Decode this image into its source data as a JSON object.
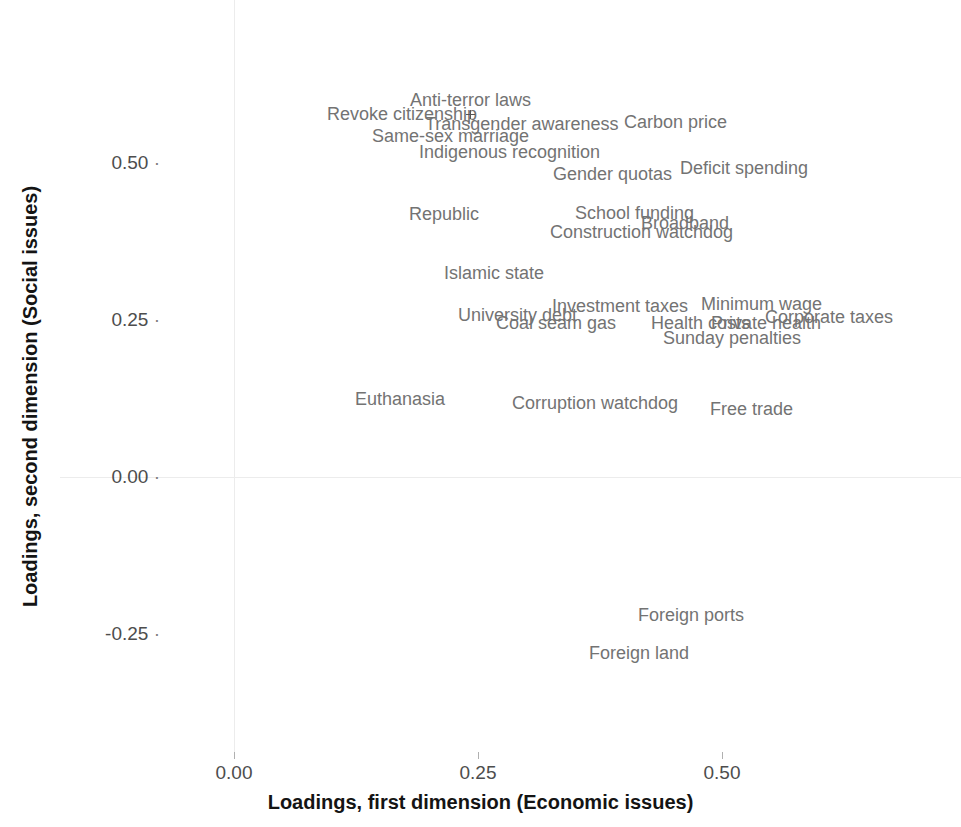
{
  "chart_data": {
    "type": "scatter",
    "title": "",
    "xlabel": "Loadings, first dimension (Economic issues)",
    "ylabel": "Loadings, second dimension (Social issues)",
    "xlim": [
      -0.09,
      0.73
    ],
    "ylim": [
      -0.36,
      0.63
    ],
    "xticks": [
      "0.00",
      "0.25",
      "0.50"
    ],
    "xtick_values": [
      0.0,
      0.25,
      0.5
    ],
    "yticks": [
      "0.50",
      "0.25",
      "0.00",
      "-0.25"
    ],
    "ytick_values": [
      0.5,
      0.25,
      0.0,
      -0.25
    ],
    "grid": "minimal-zero-lines",
    "legend": "none",
    "labels_only": true,
    "points": [
      {
        "label": "Anti-terror laws",
        "x": 0.242,
        "y": 0.6
      },
      {
        "label": "Revoke citizenship",
        "x": 0.172,
        "y": 0.578
      },
      {
        "label": "Transgender awareness",
        "x": 0.295,
        "y": 0.562
      },
      {
        "label": "Carbon price",
        "x": 0.452,
        "y": 0.565
      },
      {
        "label": "Same-sex marriage",
        "x": 0.222,
        "y": 0.543
      },
      {
        "label": "Indigenous recognition",
        "x": 0.282,
        "y": 0.518
      },
      {
        "label": "Gender quotas",
        "x": 0.388,
        "y": 0.482
      },
      {
        "label": "Deficit spending",
        "x": 0.523,
        "y": 0.492
      },
      {
        "label": "Republic",
        "x": 0.215,
        "y": 0.418
      },
      {
        "label": "School funding",
        "x": 0.41,
        "y": 0.42
      },
      {
        "label": "Broadband",
        "x": 0.462,
        "y": 0.405
      },
      {
        "label": "Construction watchdog",
        "x": 0.418,
        "y": 0.39
      },
      {
        "label": "Islamic state",
        "x": 0.266,
        "y": 0.325
      },
      {
        "label": "Investment taxes",
        "x": 0.396,
        "y": 0.272
      },
      {
        "label": "Minimum wage",
        "x": 0.54,
        "y": 0.275
      },
      {
        "label": "University debt",
        "x": 0.29,
        "y": 0.258
      },
      {
        "label": "Corporate taxes",
        "x": 0.61,
        "y": 0.255
      },
      {
        "label": "Coal seam gas",
        "x": 0.33,
        "y": 0.245
      },
      {
        "label": "Health costs",
        "x": 0.478,
        "y": 0.246
      },
      {
        "label": "Private health",
        "x": 0.545,
        "y": 0.246
      },
      {
        "label": "Sunday penalties",
        "x": 0.51,
        "y": 0.222
      },
      {
        "label": "Euthanasia",
        "x": 0.17,
        "y": 0.125
      },
      {
        "label": "Corruption watchdog",
        "x": 0.37,
        "y": 0.118
      },
      {
        "label": "Free trade",
        "x": 0.53,
        "y": 0.108
      },
      {
        "label": "Foreign ports",
        "x": 0.468,
        "y": -0.22
      },
      {
        "label": "Foreign land",
        "x": 0.415,
        "y": -0.281
      }
    ],
    "markers": [
      {
        "x": 0.242,
        "y": 0.578
      }
    ]
  },
  "axes": {
    "x_title": "Loadings, first dimension (Economic issues)",
    "y_title": "Loadings, second dimension (Social issues)",
    "x_tick_labels": [
      "0.00",
      "0.25",
      "0.50"
    ],
    "y_tick_labels": [
      "0.50",
      "0.25",
      "0.00",
      "-0.25"
    ],
    "tick_glyph": "·"
  },
  "colors": {
    "background": "#ffffff",
    "gridline": "#ececec",
    "tick_text": "#4d4d4d",
    "axis_title": "#141414",
    "point_label": "#737373"
  }
}
